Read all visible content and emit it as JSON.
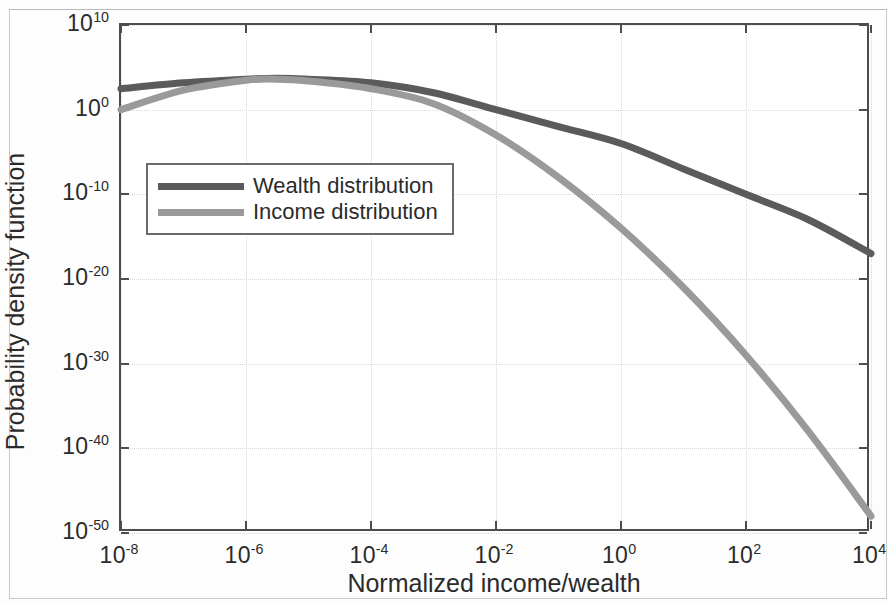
{
  "figure": {
    "background": "#ffffff",
    "axes_color": "#4d4d4d"
  },
  "axis": {
    "xlabel": "Normalized income/wealth",
    "ylabel": "Probability density function"
  },
  "legend": {
    "position": "upper-left-inside",
    "entries": [
      {
        "label": "Wealth distribution",
        "color": "#5b5b5b"
      },
      {
        "label": "Income distribution",
        "color": "#9a9a9a"
      }
    ]
  },
  "yticks": [
    {
      "base": "10",
      "exp": "10"
    },
    {
      "base": "10",
      "exp": "0"
    },
    {
      "base": "10",
      "exp": "-10"
    },
    {
      "base": "10",
      "exp": "-20"
    },
    {
      "base": "10",
      "exp": "-30"
    },
    {
      "base": "10",
      "exp": "-40"
    },
    {
      "base": "10",
      "exp": "-50"
    }
  ],
  "xticks": [
    {
      "base": "10",
      "exp": "-8"
    },
    {
      "base": "10",
      "exp": "-6"
    },
    {
      "base": "10",
      "exp": "-4"
    },
    {
      "base": "10",
      "exp": "-2"
    },
    {
      "base": "10",
      "exp": "0"
    },
    {
      "base": "10",
      "exp": "2"
    },
    {
      "base": "10",
      "exp": "4"
    }
  ],
  "chart_data": {
    "type": "line",
    "title": "",
    "xlabel": "Normalized income/wealth",
    "ylabel": "Probability density function",
    "xscale": "log",
    "yscale": "log",
    "xlim": [
      1e-08,
      10000.0
    ],
    "ylim": [
      1e-50,
      10000000000.0
    ],
    "grid": true,
    "legend_position": "upper left",
    "series": [
      {
        "name": "Wealth distribution",
        "color": "#5b5b5b",
        "linewidth": 7,
        "x": [
          1e-08,
          1e-07,
          1e-06,
          3e-06,
          1e-05,
          0.0001,
          0.001,
          0.01,
          0.1,
          1.0,
          10.0,
          100.0,
          1000.0,
          10000.0
        ],
        "y": [
          300.0,
          1500.0,
          4000.0,
          5000.0,
          4000.0,
          1500.0,
          100.0,
          1.0,
          0.01,
          0.0001,
          1e-07,
          1e-10,
          1e-13,
          1e-17
        ]
      },
      {
        "name": "Income distribution",
        "color": "#9a9a9a",
        "linewidth": 7,
        "x": [
          1e-08,
          1e-07,
          1e-06,
          3e-06,
          1e-05,
          0.0001,
          0.001,
          0.01,
          0.1,
          1.0,
          10.0,
          100.0,
          1000.0,
          10000.0
        ],
        "y": [
          1.0,
          200.0,
          3000.0,
          4000.0,
          2500.0,
          300.0,
          5.0,
          0.001,
          1e-08,
          1e-14,
          1e-21,
          1e-29,
          1e-38,
          1e-48
        ]
      }
    ]
  }
}
